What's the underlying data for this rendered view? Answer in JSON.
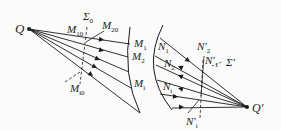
{
  "diagram": {
    "type": "optics-ray-diagram",
    "labels": {
      "source": "Q",
      "image": "Q′",
      "wavefront_left": "Σ",
      "wavefront_left_sub": "0",
      "wavefront_right": "Σ′",
      "m10": {
        "main": "M",
        "sub": "10"
      },
      "m20": {
        "main": "M",
        "sub": "20"
      },
      "mi0": {
        "main": "M",
        "sub": "i0"
      },
      "m1": {
        "main": "M",
        "sub": "1"
      },
      "m2": {
        "main": "M",
        "sub": "2"
      },
      "mi": {
        "main": "M",
        "sub": "i"
      },
      "n1": {
        "main": "N",
        "sub": "1"
      },
      "n2": {
        "main": "N",
        "sub": "2"
      },
      "ni": {
        "main": "N",
        "sub": "i"
      },
      "n2p": {
        "main": "N′",
        "sub": "2"
      },
      "n1p": {
        "main": "N′",
        "sub": "1"
      },
      "nip": {
        "main": "N′",
        "sub": "i"
      }
    },
    "colors": {
      "line": "#1a1a1a",
      "background": "#fbfbfb"
    }
  }
}
